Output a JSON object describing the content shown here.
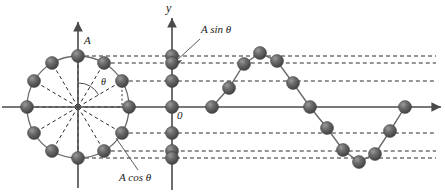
{
  "figure": {
    "labels": {
      "amplitude": "A",
      "y_axis": "y",
      "origin": "0",
      "theta": "θ",
      "a_sin_theta": "A sin θ",
      "a_cos_theta": "A cos θ"
    },
    "colors": {
      "dot_fill": "#5a5a5a",
      "dot_highlight": "#8e8e8e",
      "dot_edge": "#3a3a3a",
      "axis": "#4a4a4a",
      "curve": "#6a6a6a",
      "dashed": "#2b2b2b",
      "text": "#1a1a1a",
      "background": "#ffffff"
    }
  },
  "geometry": {
    "circle": {
      "cx": 78,
      "cy": 107,
      "r": 51,
      "dot_count": 12,
      "dot_radius": 6.5
    },
    "axes": {
      "x_axis_y": 107,
      "x_axis_x0": 2,
      "x_axis_x1": 441,
      "circle_axis_x": 78,
      "circle_axis_y0": 22,
      "circle_axis_y1": 188,
      "y_axis_x": 172,
      "y_axis_y0": 18,
      "y_axis_y1": 190
    }
  },
  "chart_data": {
    "type": "scatter",
    "xlabel": "θ",
    "ylabel": "y",
    "amplitude": "A",
    "grid": false,
    "legend": null,
    "circle_points": [
      {
        "angle_deg": 90,
        "label": "A",
        "x": 78,
        "y": 56
      },
      {
        "angle_deg": 60,
        "label": "",
        "x": 104,
        "y": 63
      },
      {
        "angle_deg": 30,
        "label": "",
        "x": 122,
        "y": 81
      },
      {
        "angle_deg": 0,
        "label": "",
        "x": 129,
        "y": 107
      },
      {
        "angle_deg": 330,
        "label": "",
        "x": 122,
        "y": 133
      },
      {
        "angle_deg": 300,
        "label": "",
        "x": 104,
        "y": 151
      },
      {
        "angle_deg": 270,
        "label": "",
        "x": 78,
        "y": 158
      },
      {
        "angle_deg": 240,
        "label": "",
        "x": 52,
        "y": 151
      },
      {
        "angle_deg": 210,
        "label": "",
        "x": 34,
        "y": 133
      },
      {
        "angle_deg": 180,
        "label": "",
        "x": 27,
        "y": 107
      },
      {
        "angle_deg": 150,
        "label": "",
        "x": 34,
        "y": 81
      },
      {
        "angle_deg": 120,
        "label": "",
        "x": 52,
        "y": 63
      }
    ],
    "axis_column_points": [
      {
        "x": 172,
        "y": 56
      },
      {
        "x": 172,
        "y": 63
      },
      {
        "x": 172,
        "y": 81
      },
      {
        "x": 172,
        "y": 107
      },
      {
        "x": 172,
        "y": 133
      },
      {
        "x": 172,
        "y": 151
      },
      {
        "x": 172,
        "y": 158
      }
    ],
    "wave_points": [
      {
        "theta_deg": 0,
        "x": 212,
        "y": 107
      },
      {
        "theta_deg": 30,
        "x": 229,
        "y": 88
      },
      {
        "theta_deg": 60,
        "x": 244,
        "y": 64
      },
      {
        "theta_deg": 90,
        "x": 260,
        "y": 53
      },
      {
        "theta_deg": 120,
        "x": 277,
        "y": 61
      },
      {
        "theta_deg": 150,
        "x": 293,
        "y": 83
      },
      {
        "theta_deg": 180,
        "x": 310,
        "y": 107
      },
      {
        "theta_deg": 210,
        "x": 327,
        "y": 128
      },
      {
        "theta_deg": 240,
        "x": 343,
        "y": 150
      },
      {
        "theta_deg": 270,
        "x": 359,
        "y": 162
      },
      {
        "theta_deg": 300,
        "x": 375,
        "y": 154
      },
      {
        "theta_deg": 330,
        "x": 390,
        "y": 131
      },
      {
        "theta_deg": 360,
        "x": 405,
        "y": 107
      }
    ],
    "projection_lines_y": [
      56,
      63,
      81,
      133,
      151,
      158
    ],
    "ylim": [
      "-A",
      "A"
    ],
    "xlim": [
      0,
      360
    ]
  }
}
